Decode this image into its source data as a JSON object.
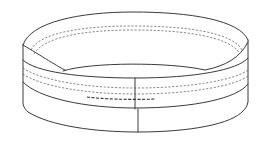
{
  "figure": {
    "style": "black line art on white",
    "colors": {
      "background": "#ffffff",
      "line": "#3a3a3a"
    }
  }
}
